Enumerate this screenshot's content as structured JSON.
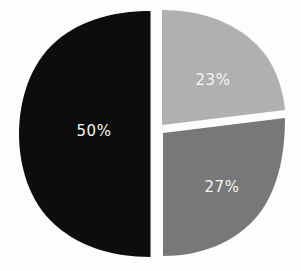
{
  "figure": {
    "background_color": "#fdfdfd",
    "gap_color": "#ffffff",
    "label_color": "#f4f4f4",
    "watermark": ""
  },
  "chart_data": {
    "type": "pie",
    "title": "",
    "subtitle": "",
    "xlabel": "",
    "ylabel": "",
    "legend": "none",
    "grid": false,
    "style": "hand-drawn exploded pie chart, rounded-square (squircle) outline",
    "total": 100,
    "units": "percent",
    "categories": [
      "50%",
      "23%",
      "27%"
    ],
    "values": [
      50,
      23,
      27
    ],
    "colors": [
      "#0d0d0d",
      "#b0b0b0",
      "#787878"
    ],
    "slices": [
      {
        "label": "50%",
        "value": 50,
        "color": "#0d0d0d",
        "position": "left half",
        "start_angle_deg": 90,
        "end_angle_deg": 270,
        "label_x": 94,
        "label_y": 136
      },
      {
        "label": "23%",
        "value": 23,
        "color": "#b0b0b0",
        "position": "upper right",
        "start_angle_deg": -82,
        "end_angle_deg": 0,
        "label_x": 213,
        "label_y": 85
      },
      {
        "label": "27%",
        "value": 27,
        "color": "#787878",
        "position": "lower right",
        "start_angle_deg": 0,
        "end_angle_deg": 90,
        "label_x": 222,
        "label_y": 192
      }
    ]
  }
}
